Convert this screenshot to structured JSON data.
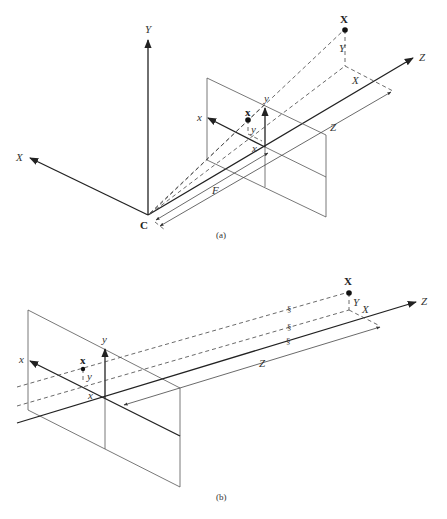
{
  "figure": {
    "panels": [
      {
        "id": "a",
        "caption": "(a)",
        "description": "Perspective projection: camera center C with world axes X, Y, Z; image plane at focal distance F",
        "labels": {
          "world_Y": "Y",
          "world_X": "X",
          "world_Z": "Z",
          "center": "C",
          "point_3d": "X",
          "point_3d_Y": "Y",
          "point_3d_X": "X",
          "image_point": "x",
          "image_x_axis": "x",
          "image_y_axis": "y",
          "image_point_y": "y",
          "image_point_x": "x",
          "depth": "Z",
          "focal": "F"
        }
      },
      {
        "id": "b",
        "caption": "(b)",
        "description": "Orthographic projection: parallel projection rays onto the image plane",
        "labels": {
          "world_Z": "Z",
          "point_3d": "X",
          "point_3d_Y": "Y",
          "point_3d_X": "X",
          "image_point": "x",
          "image_x_axis": "x",
          "image_y_axis": "y",
          "image_point_y": "y",
          "image_point_x": "x",
          "depth": "Z",
          "break_mark": "§"
        }
      }
    ]
  }
}
